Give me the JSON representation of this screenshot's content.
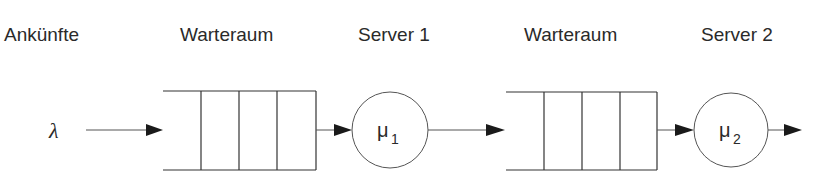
{
  "diagram": {
    "labels": {
      "arrivals": "Ankünfte",
      "queue1": "Warteraum",
      "server1": "Server 1",
      "queue2": "Warteraum",
      "server2": "Server 2"
    },
    "arrival_rate": "λ",
    "server1": {
      "rate_symbol": "μ",
      "rate_index": "1"
    },
    "server2": {
      "rate_symbol": "μ",
      "rate_index": "2"
    },
    "queue_slots": 3,
    "colors": {
      "stroke": "#333333",
      "text": "#2a2a2a",
      "background": "#ffffff"
    }
  }
}
